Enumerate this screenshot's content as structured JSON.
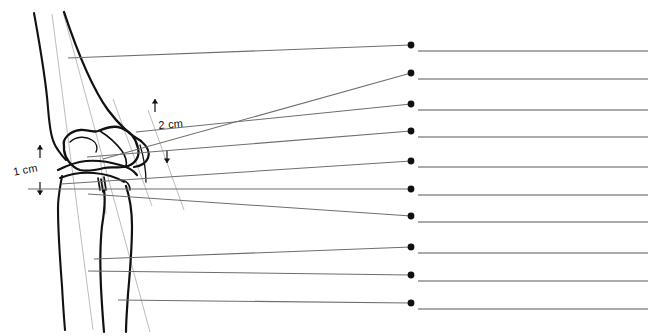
{
  "figure": {
    "background_color": "#ffffff",
    "bone_outline_color": "#111111",
    "construction_line_color": "#b4b4b4",
    "leader_line_color": "#6e6e6e",
    "label_line_color": "#aaaaaa",
    "dot_color": "#111111",
    "width": 653,
    "height": 336
  },
  "measurements": [
    {
      "id": "m1",
      "text": "1 cm",
      "x": 12,
      "y": 166,
      "rotation": -11
    },
    {
      "id": "m2",
      "text": "2 cm",
      "x": 158,
      "y": 119,
      "rotation": -5
    }
  ],
  "bones": [
    {
      "name": "femur-shaft-anterior",
      "color": "#111111"
    },
    {
      "name": "femur-shaft-posterior",
      "color": "#111111"
    },
    {
      "name": "femoral-condyle",
      "color": "#111111"
    },
    {
      "name": "patella",
      "color": "#111111"
    },
    {
      "name": "tibial-plateau",
      "color": "#111111"
    },
    {
      "name": "tibia-shaft",
      "color": "#111111"
    },
    {
      "name": "fibula",
      "color": "#111111"
    }
  ],
  "construction_lines": [
    {
      "name": "femoral-mechanical-axis",
      "x1": 52,
      "y1": 14,
      "x2": 93,
      "y2": 330
    },
    {
      "name": "tibial-anatomic-axis",
      "x1": 63,
      "y1": 12,
      "x2": 150,
      "y2": 332
    },
    {
      "name": "posterior-cortical-line",
      "x1": 113,
      "y1": 99,
      "x2": 152,
      "y2": 206
    },
    {
      "name": "condylar-reference-line",
      "x1": 148,
      "y1": 110,
      "x2": 184,
      "y2": 210
    },
    {
      "name": "joint-line-perpendicular",
      "x1": 100,
      "y1": 155,
      "x2": 106,
      "y2": 214
    }
  ],
  "label_rows": [
    {
      "index": 1,
      "dot_x": 411,
      "dot_y": 45,
      "line_y": 51,
      "line_x1": 418,
      "line_x2": 648,
      "leader_x1": 68,
      "leader_y1": 58,
      "leader_x2": 411,
      "leader_y2": 45,
      "text": ""
    },
    {
      "index": 2,
      "dot_x": 411,
      "dot_y": 73,
      "line_y": 79,
      "line_x1": 418,
      "line_x2": 648,
      "leader_x1": 103,
      "leader_y1": 159,
      "leader_x2": 411,
      "leader_y2": 73,
      "text": ""
    },
    {
      "index": 3,
      "dot_x": 411,
      "dot_y": 104,
      "line_y": 110,
      "line_x1": 418,
      "line_x2": 648,
      "leader_x1": 136,
      "leader_y1": 132,
      "leader_x2": 411,
      "leader_y2": 104,
      "text": ""
    },
    {
      "index": 4,
      "dot_x": 411,
      "dot_y": 131,
      "line_y": 137,
      "line_x1": 418,
      "line_x2": 648,
      "leader_x1": 87,
      "leader_y1": 157,
      "leader_x2": 411,
      "leader_y2": 131,
      "text": ""
    },
    {
      "index": 5,
      "dot_x": 411,
      "dot_y": 161,
      "line_y": 167,
      "line_x1": 418,
      "line_x2": 648,
      "leader_x1": 61,
      "leader_y1": 184,
      "leader_x2": 411,
      "leader_y2": 161,
      "text": ""
    },
    {
      "index": 6,
      "dot_x": 411,
      "dot_y": 189,
      "line_y": 195,
      "line_x1": 418,
      "line_x2": 648,
      "leader_x1": 28,
      "leader_y1": 189,
      "leader_x2": 411,
      "leader_y2": 189,
      "text": ""
    },
    {
      "index": 7,
      "dot_x": 411,
      "dot_y": 216,
      "line_y": 222,
      "line_x1": 418,
      "line_x2": 648,
      "leader_x1": 88,
      "leader_y1": 194,
      "leader_x2": 411,
      "leader_y2": 216,
      "text": ""
    },
    {
      "index": 8,
      "dot_x": 411,
      "dot_y": 247,
      "line_y": 253,
      "line_x1": 418,
      "line_x2": 648,
      "leader_x1": 94,
      "leader_y1": 259,
      "leader_x2": 411,
      "leader_y2": 247,
      "text": ""
    },
    {
      "index": 9,
      "dot_x": 411,
      "dot_y": 275,
      "line_y": 281,
      "line_x1": 418,
      "line_x2": 648,
      "leader_x1": 88,
      "leader_y1": 271,
      "leader_x2": 411,
      "leader_y2": 275,
      "text": ""
    },
    {
      "index": 10,
      "dot_x": 411,
      "dot_y": 303,
      "line_y": 309,
      "line_x1": 418,
      "line_x2": 648,
      "leader_x1": 118,
      "leader_y1": 300,
      "leader_x2": 411,
      "leader_y2": 303,
      "text": ""
    }
  ],
  "arrows": [
    {
      "name": "arrow-1cm-upper",
      "x": 40,
      "y": 158,
      "direction": "up"
    },
    {
      "name": "arrow-1cm-lower",
      "x": 40,
      "y": 182,
      "direction": "down"
    },
    {
      "name": "arrow-2cm-upper",
      "x": 155,
      "y": 112,
      "direction": "up"
    },
    {
      "name": "arrow-2cm-lower",
      "x": 167,
      "y": 150,
      "direction": "down"
    }
  ]
}
